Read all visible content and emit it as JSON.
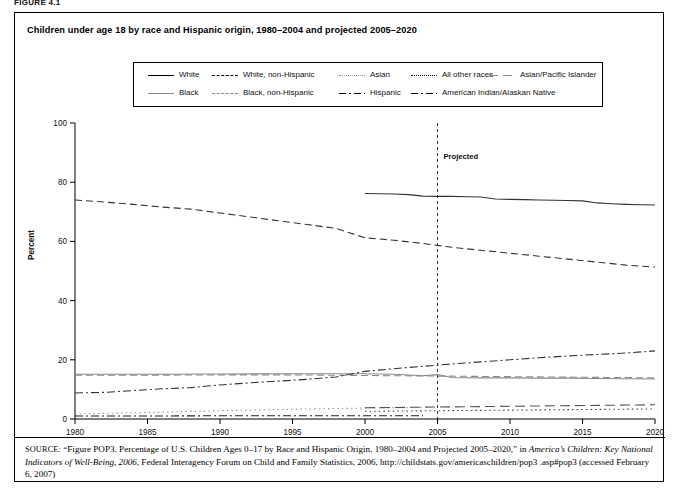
{
  "figure_label": "FIGURE 4.1",
  "chart_title": "Children under age 18 by race and Hispanic origin, 1980–2004 and projected 2005–2020",
  "axes": {
    "ylabel": "Percent",
    "yticks": [
      "0",
      "20",
      "40",
      "60",
      "80",
      "100"
    ],
    "xticks": [
      "1980",
      "1985",
      "1990",
      "1995",
      "2000",
      "2005",
      "2010",
      "2015",
      "2020"
    ]
  },
  "annotation": {
    "projected_label": "Projected",
    "projected_year": 2005
  },
  "legend": {
    "items": [
      {
        "label": "White",
        "style": "solid"
      },
      {
        "label": "White, non-Hispanic",
        "style": "dash"
      },
      {
        "label": "Asian",
        "style": "dot-gray"
      },
      {
        "label": "All other races",
        "style": "dot"
      },
      {
        "label": "Asian/Pacific Islander",
        "style": "longdash-gray"
      },
      {
        "label": "Black",
        "style": "solid-gray"
      },
      {
        "label": "Black, non-Hispanic",
        "style": "dash-gray"
      },
      {
        "label": "Hispanic",
        "style": "dashdot"
      },
      {
        "label": "American Indian/Alaskan Native",
        "style": "dashdot"
      }
    ]
  },
  "source": {
    "prefix": "SOURCE:",
    "text_1": " “Figure POP3. Percentage of U.S. Children Ages 0–17 by Race and Hispanic Origin, 1980–2004 and Projected 2005–2020,” in ",
    "italic_1": "America’s Children: Key National Indicators of Well-Being, 2006",
    "text_2": ", Federal Interagency Forum on Child and Family Statistics, 2006, http://childstats.gov/americaschildren/pop3 .asp#pop3 (accessed February 6, 2007)"
  },
  "chart_data": {
    "type": "line",
    "title": "Children under age 18 by race and Hispanic origin, 1980–2004 and projected 2005–2020",
    "xlabel": "",
    "ylabel": "Percent",
    "xlim": [
      1980,
      2020
    ],
    "ylim": [
      0,
      100
    ],
    "grid": false,
    "legend_position": "top",
    "projected_start": 2005,
    "series": [
      {
        "name": "White",
        "style": "solid",
        "color": "#333333",
        "x": [
          2000,
          2001,
          2002,
          2003,
          2004,
          2005,
          2006,
          2007,
          2008,
          2009,
          2010,
          2011,
          2012,
          2013,
          2014,
          2015,
          2016,
          2017,
          2018,
          2019,
          2020
        ],
        "values": [
          76.2,
          76.1,
          76.0,
          75.8,
          75.3,
          75.2,
          75.2,
          75.1,
          75.0,
          74.3,
          74.2,
          74.1,
          74.0,
          73.9,
          73.8,
          73.7,
          73.0,
          72.7,
          72.5,
          72.4,
          72.3
        ]
      },
      {
        "name": "White, non-Hispanic",
        "style": "dash",
        "color": "#333333",
        "x": [
          1980,
          1982,
          1984,
          1986,
          1988,
          1990,
          1992,
          1994,
          1996,
          1998,
          2000,
          2002,
          2004,
          2006,
          2008,
          2010,
          2012,
          2014,
          2016,
          2018,
          2020
        ],
        "values": [
          74.0,
          73.3,
          72.5,
          71.6,
          70.9,
          69.6,
          68.3,
          67.0,
          65.7,
          64.4,
          61.2,
          60.4,
          59.3,
          58.0,
          57.0,
          56.0,
          55.0,
          54.0,
          53.0,
          52.0,
          51.3
        ]
      },
      {
        "name": "Black",
        "style": "solid-gray",
        "color": "#8a8a8a",
        "x": [
          1980,
          1985,
          1990,
          1995,
          2000,
          2002,
          2004,
          2005,
          2006,
          2008,
          2010,
          2012,
          2014,
          2016,
          2018,
          2020
        ],
        "values": [
          15.1,
          15.1,
          15.2,
          15.3,
          15.3,
          15.1,
          14.6,
          15.0,
          14.0,
          13.9,
          13.9,
          13.8,
          13.8,
          13.7,
          13.6,
          13.5
        ]
      },
      {
        "name": "Black, non-Hispanic",
        "style": "dash-gray",
        "color": "#8a8a8a",
        "x": [
          1980,
          1985,
          1990,
          1995,
          2000,
          2005,
          2010,
          2015,
          2020
        ],
        "values": [
          14.8,
          14.8,
          14.9,
          14.9,
          14.7,
          14.5,
          14.3,
          14.1,
          13.9
        ]
      },
      {
        "name": "Hispanic",
        "style": "dashdot",
        "color": "#333333",
        "x": [
          1980,
          1982,
          1984,
          1986,
          1988,
          1990,
          1992,
          1994,
          1996,
          1998,
          2000,
          2002,
          2004,
          2006,
          2008,
          2010,
          2012,
          2014,
          2016,
          2018,
          2020
        ],
        "values": [
          8.8,
          9.0,
          9.6,
          10.2,
          10.6,
          11.5,
          12.2,
          12.8,
          13.4,
          14.2,
          16.1,
          17.0,
          17.8,
          18.6,
          19.3,
          20.0,
          20.7,
          21.3,
          21.8,
          22.3,
          23.0
        ]
      },
      {
        "name": "Asian",
        "style": "dot-gray",
        "color": "#9a9a9a",
        "x": [
          1980,
          1985,
          1990,
          1995,
          2000,
          2002,
          2004
        ],
        "values": [
          1.7,
          2.2,
          2.8,
          3.3,
          3.7,
          3.8,
          3.9
        ]
      },
      {
        "name": "Asian/Pacific Islander",
        "style": "longdash-gray",
        "color": "#555555",
        "x": [
          2000,
          2004,
          2008,
          2012,
          2016,
          2020
        ],
        "values": [
          3.8,
          4.0,
          4.2,
          4.4,
          4.6,
          4.8
        ]
      },
      {
        "name": "All other races",
        "style": "dot",
        "color": "#444444",
        "x": [
          2000,
          2005,
          2010,
          2015,
          2020
        ],
        "values": [
          2.6,
          2.8,
          3.0,
          3.2,
          3.4
        ]
      },
      {
        "name": "American Indian/Alaskan Native",
        "style": "dashdot",
        "color": "#222222",
        "x": [
          1980,
          1985,
          1990,
          1995,
          2000,
          2002,
          2004
        ],
        "values": [
          1.0,
          1.0,
          1.1,
          1.1,
          1.1,
          1.1,
          1.1
        ]
      }
    ]
  }
}
